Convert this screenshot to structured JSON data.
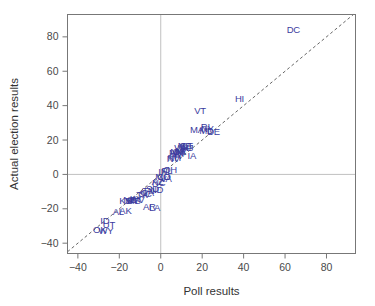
{
  "chart_data": {
    "type": "scatter",
    "title": "",
    "xlabel": "Poll results",
    "ylabel": "Actual election results",
    "xlim": [
      -45,
      94
    ],
    "ylim": [
      -46,
      93
    ],
    "xticks": [
      -40,
      -20,
      0,
      20,
      40,
      60,
      80
    ],
    "yticks": [
      -40,
      -20,
      0,
      20,
      40,
      60,
      80
    ],
    "xticklabels": [
      "−40",
      "−20",
      "0",
      "20",
      "40",
      "60",
      "80"
    ],
    "yticklabels": [
      "−40",
      "−20",
      "0",
      "20",
      "40",
      "60",
      "80"
    ],
    "grid": false,
    "reference_lines": [
      {
        "name": "x-zero-line",
        "type": "vertical",
        "value": 0,
        "color": "#b0b0b0"
      },
      {
        "name": "y-zero-line",
        "type": "horizontal",
        "value": 0,
        "color": "#b0b0b0"
      },
      {
        "name": "identity-line",
        "type": "diagonal",
        "style": "dashed",
        "color": "#666666",
        "from": [
          -45,
          -45
        ],
        "to": [
          93,
          93
        ]
      }
    ],
    "legend": null,
    "marker_style": "text-label",
    "label_color": "#3b3b9e",
    "points": [
      {
        "label": "DC",
        "x": 64.0,
        "y": 84.0
      },
      {
        "label": "HI",
        "x": 38.0,
        "y": 44.0
      },
      {
        "label": "VT",
        "x": 19.0,
        "y": 37.0
      },
      {
        "label": "MA",
        "x": 17.5,
        "y": 26.0
      },
      {
        "label": "RI",
        "x": 21.5,
        "y": 28.0
      },
      {
        "label": "NY",
        "x": 22.5,
        "y": 26.5
      },
      {
        "label": "DE",
        "x": 25.5,
        "y": 25.0
      },
      {
        "label": "MD",
        "x": 22.0,
        "y": 25.5
      },
      {
        "label": "NJ",
        "x": 13.0,
        "y": 15.5
      },
      {
        "label": "IA",
        "x": 15.0,
        "y": 11.0
      },
      {
        "label": "CA",
        "x": 12.0,
        "y": 16.5
      },
      {
        "label": "IL",
        "x": 11.0,
        "y": 16.0
      },
      {
        "label": "CT",
        "x": 12.5,
        "y": 17.0
      },
      {
        "label": "ME",
        "x": 11.5,
        "y": 16.5
      },
      {
        "label": "WA",
        "x": 10.0,
        "y": 15.5
      },
      {
        "label": "MI",
        "x": 9.5,
        "y": 14.0
      },
      {
        "label": "OR",
        "x": 9.0,
        "y": 13.0
      },
      {
        "label": "NM",
        "x": 8.0,
        "y": 13.5
      },
      {
        "label": "WI",
        "x": 8.5,
        "y": 12.0
      },
      {
        "label": "MN",
        "x": 7.5,
        "y": 12.5
      },
      {
        "label": "PA",
        "x": 7.0,
        "y": 11.0
      },
      {
        "label": "NH",
        "x": 6.5,
        "y": 10.0
      },
      {
        "label": "NV",
        "x": 6.0,
        "y": 9.0
      },
      {
        "label": "OH",
        "x": 4.5,
        "y": 3.0
      },
      {
        "label": "FL",
        "x": 3.0,
        "y": 2.5
      },
      {
        "label": "IN",
        "x": 1.0,
        "y": 1.5
      },
      {
        "label": "CO",
        "x": 1.5,
        "y": -1.0
      },
      {
        "label": "MO",
        "x": 1.0,
        "y": -1.5
      },
      {
        "label": "VA",
        "x": 2.5,
        "y": -2.5
      },
      {
        "label": "AZ",
        "x": -1.5,
        "y": -4.0
      },
      {
        "label": "NC",
        "x": -1.0,
        "y": -5.0
      },
      {
        "label": "SD",
        "x": -4.0,
        "y": -8.0
      },
      {
        "label": "ND",
        "x": -2.0,
        "y": -9.0
      },
      {
        "label": "TN",
        "x": -6.0,
        "y": -9.5
      },
      {
        "label": "GA",
        "x": -6.5,
        "y": -10.5
      },
      {
        "label": "SC",
        "x": -7.5,
        "y": -11.0
      },
      {
        "label": "TX",
        "x": -9.0,
        "y": -12.0
      },
      {
        "label": "AR",
        "x": -5.5,
        "y": -19.0
      },
      {
        "label": "LA",
        "x": -3.0,
        "y": -19.5
      },
      {
        "label": "KY",
        "x": -12.0,
        "y": -14.0
      },
      {
        "label": "WV",
        "x": -11.5,
        "y": -14.5
      },
      {
        "label": "MS",
        "x": -13.0,
        "y": -15.0
      },
      {
        "label": "MT",
        "x": -14.0,
        "y": -15.5
      },
      {
        "label": "NE",
        "x": -15.0,
        "y": -14.5
      },
      {
        "label": "KS",
        "x": -17.0,
        "y": -15.0
      },
      {
        "label": "AL",
        "x": -20.5,
        "y": -21.5
      },
      {
        "label": "AK",
        "x": -17.0,
        "y": -21.0
      },
      {
        "label": "ID",
        "x": -27.0,
        "y": -27.0
      },
      {
        "label": "UT",
        "x": -25.0,
        "y": -29.0
      },
      {
        "label": "OK",
        "x": -29.5,
        "y": -32.0
      },
      {
        "label": "WY",
        "x": -26.5,
        "y": -32.5
      }
    ]
  }
}
